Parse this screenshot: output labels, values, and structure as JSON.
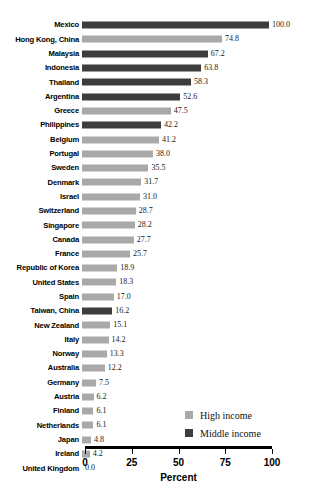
{
  "chart_data": {
    "type": "bar",
    "orientation": "horizontal",
    "title": "",
    "xlabel": "Percent",
    "ylabel": "",
    "xlim": [
      0,
      100
    ],
    "xticks": [
      "0",
      "25",
      "50",
      "75",
      "100"
    ],
    "xtick_values": [
      0,
      25,
      50,
      75,
      100
    ],
    "grid": false,
    "legend_position": "lower-right",
    "categories": [
      "Mexico",
      "Hong Kong, China",
      "Malaysia",
      "Indonesia",
      "Thailand",
      "Argentina",
      "Greece",
      "Philippines",
      "Belgium",
      "Portugal",
      "Sweden",
      "Denmark",
      "Israel",
      "Switzerland",
      "Singapore",
      "Canada",
      "France",
      "Republic of Korea",
      "United States",
      "Spain",
      "Taiwan, China",
      "New Zealand",
      "Italy",
      "Norway",
      "Australia",
      "Germany",
      "Austria",
      "Finland",
      "Netherlands",
      "Japan",
      "Ireland",
      "United Kingdom"
    ],
    "values": [
      100.0,
      74.8,
      67.2,
      63.8,
      58.3,
      52.6,
      47.5,
      42.2,
      41.2,
      38.0,
      35.5,
      31.7,
      31.0,
      28.7,
      28.2,
      27.7,
      25.7,
      18.9,
      18.3,
      17.0,
      16.2,
      15.1,
      14.2,
      13.3,
      12.2,
      7.5,
      6.2,
      6.1,
      6.1,
      4.8,
      4.2,
      0.0
    ],
    "value_labels": [
      "100.0",
      "74.8",
      "67.2",
      "63.8",
      "58.3",
      "52.6",
      "47.5",
      "42.2",
      "41.2",
      "38.0",
      "35.5",
      "31.7",
      "31.0",
      "28.7",
      "28.2",
      "27.7",
      "25.7",
      "18.9",
      "18.3",
      "17.0",
      "16.2",
      "15.1",
      "14.2",
      "13.3",
      "12.2",
      "7.5",
      "6.2",
      "6.1",
      "6.1",
      "4.8",
      "4.2",
      "0.0"
    ],
    "groups": [
      "middle",
      "high",
      "middle",
      "middle",
      "middle",
      "middle",
      "high",
      "middle",
      "high",
      "high",
      "high",
      "high",
      "high",
      "high",
      "high",
      "high",
      "high",
      "high",
      "high",
      "high",
      "middle",
      "high",
      "high",
      "high",
      "high",
      "high",
      "high",
      "high",
      "high",
      "high",
      "high",
      "high"
    ],
    "series": [
      {
        "name": "High income",
        "key": "high",
        "color": "#a9a9a9"
      },
      {
        "name": "Middle income",
        "key": "middle",
        "color": "#3d3d3d"
      }
    ]
  },
  "legend": {
    "items": [
      {
        "label": "High income",
        "key": "high"
      },
      {
        "label": "Middle income",
        "key": "middle"
      }
    ]
  },
  "axis": {
    "title": "Percent"
  }
}
